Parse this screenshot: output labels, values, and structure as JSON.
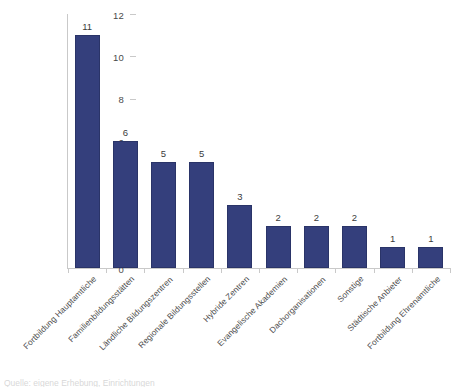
{
  "chart_data": {
    "type": "bar",
    "title": "",
    "subtitle": "",
    "xlabel": "",
    "ylabel": "",
    "ylim": [
      0,
      12
    ],
    "ytick_labels": [
      "0",
      "2",
      "4",
      "6",
      "8",
      "10",
      "12"
    ],
    "ytick_values": [
      0,
      2,
      4,
      6,
      8,
      10,
      12
    ],
    "grid": false,
    "legend": false,
    "legend_position": "none",
    "bar_color": "#343F7C",
    "bar_border_color": "#2A3468",
    "axis_color": "#C9C9C9",
    "label_rotation_degrees": -45,
    "data_labels_shown": true,
    "categories": [
      "Fortbildung Hauptamtliche",
      "Familienbildungsstätten",
      "Ländliche Bildungszentren",
      "Regionale Bildungsstellen",
      "Hybride Zentren",
      "Evangelische Akademien",
      "Dachorganisationen",
      "Sonstige",
      "Städtische Anbieter",
      "Fortbildung Ehrenamtliche"
    ],
    "values": [
      11,
      6,
      5,
      5,
      3,
      2,
      2,
      2,
      1,
      1
    ],
    "value_labels": [
      "11",
      "6",
      "5",
      "5",
      "3",
      "2",
      "2",
      "2",
      "1",
      "1"
    ]
  },
  "footer": {
    "source_note": "Quelle: eigene Erhebung, Einrichtungen"
  }
}
